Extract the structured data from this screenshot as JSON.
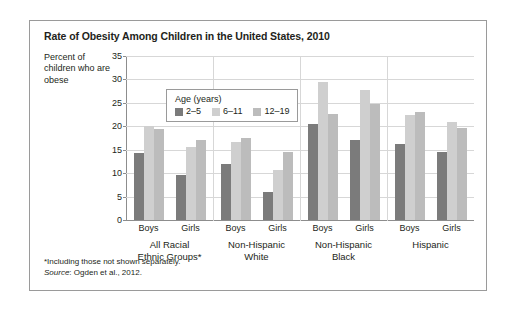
{
  "title": "Rate of Obesity Among Children in the United States, 2010",
  "axis_title": "Percent of children who are obese",
  "legend": {
    "title": "Age (years)",
    "items": [
      {
        "label": "2–5",
        "color": "#7b7b7b"
      },
      {
        "label": "6–11",
        "color": "#cfcfcf"
      },
      {
        "label": "12–19",
        "color": "#bcbcbc"
      }
    ]
  },
  "footnote": "*Including those not shown separately.",
  "source_prefix": "Source",
  "source_text": ": Ogden et al., 2012.",
  "groups": [
    {
      "label_line1": "All Racial",
      "label_line2": "Ethnic Groups*"
    },
    {
      "label_line1": "Non-Hispanic",
      "label_line2": "White"
    },
    {
      "label_line1": "Non-Hispanic",
      "label_line2": "Black"
    },
    {
      "label_line1": "Hispanic",
      "label_line2": ""
    }
  ],
  "sub_labels": [
    "Boys",
    "Girls"
  ],
  "chart_data": {
    "type": "bar",
    "title": "Rate of Obesity Among Children in the United States, 2010",
    "xlabel": "",
    "ylabel": "Percent of children who are obese",
    "ylim": [
      0,
      35
    ],
    "ytick_step": 5,
    "yticks": [
      0,
      5,
      10,
      15,
      20,
      25,
      30,
      35
    ],
    "grid": true,
    "legend_position": "inside-top-left",
    "categories": [
      "All Racial Ethnic Groups* — Boys",
      "All Racial Ethnic Groups* — Girls",
      "Non-Hispanic White — Boys",
      "Non-Hispanic White — Girls",
      "Non-Hispanic Black — Boys",
      "Non-Hispanic Black — Girls",
      "Hispanic — Boys",
      "Hispanic — Girls"
    ],
    "series": [
      {
        "name": "2–5",
        "color": "#7b7b7b",
        "values": [
          14.3,
          9.6,
          11.9,
          5.9,
          20.5,
          17.0,
          16.2,
          14.6
        ]
      },
      {
        "name": "6–11",
        "color": "#cfcfcf",
        "values": [
          20.1,
          15.6,
          16.7,
          10.6,
          29.5,
          27.8,
          22.4,
          20.9
        ]
      },
      {
        "name": "12–19",
        "color": "#bcbcbc",
        "values": [
          19.4,
          17.1,
          17.4,
          14.5,
          22.6,
          24.8,
          23.1,
          19.7
        ]
      }
    ]
  }
}
